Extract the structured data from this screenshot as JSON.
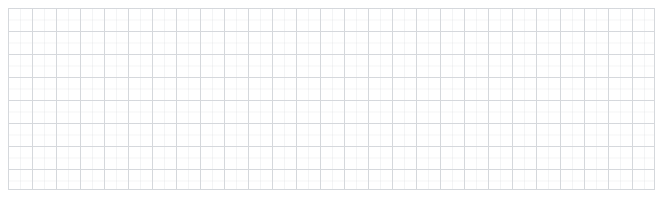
{
  "canvas": {
    "name": "empty-grid-canvas",
    "width_px": 664,
    "height_px": 202,
    "background_color": "#ffffff",
    "content_text": "",
    "description": "Blank graph-paper style grid surface with no data, labels, or controls rendered."
  },
  "grid": {
    "line_color": "#d5d8dc",
    "minor_line_color": "rgba(213,216,220,0.28)",
    "line_width_px": 1,
    "cell_width_px": 24,
    "cell_height_px": 23,
    "columns": 27,
    "rows": 8,
    "offset_left_px": 8,
    "offset_top_px": 8,
    "surface_width_px": 647,
    "surface_height_px": 182
  },
  "chart_data": {
    "type": "scatter",
    "title": "",
    "subtitle": "",
    "xlabel": "",
    "ylabel": "",
    "categories": [],
    "x": [],
    "values": [],
    "series": [],
    "legend_entries": [],
    "annotations": [],
    "tick_labels_x": [],
    "tick_labels_y": [],
    "xlim": [
      0,
      27
    ],
    "ylim": [
      0,
      8
    ],
    "grid": true,
    "legend_position": "none",
    "note": "Empty plot area: only gridlines are drawn; no data points, axes labels, ticks or legend are visible in the pixels."
  }
}
